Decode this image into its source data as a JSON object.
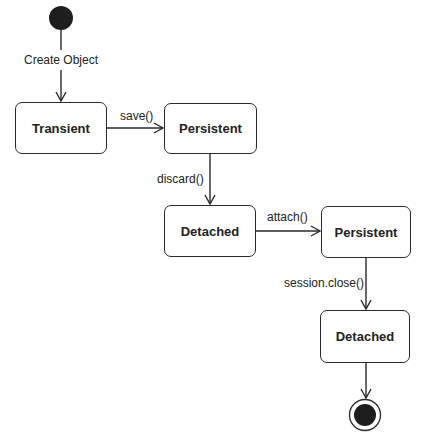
{
  "diagram": {
    "type": "UML state diagram",
    "initial_label": "Create Object",
    "states": [
      {
        "id": "transient",
        "label": "Transient"
      },
      {
        "id": "persistent1",
        "label": "Persistent"
      },
      {
        "id": "detached1",
        "label": "Detached"
      },
      {
        "id": "persistent2",
        "label": "Persistent"
      },
      {
        "id": "detached2",
        "label": "Detached"
      }
    ],
    "transitions": [
      {
        "from": "initial",
        "to": "transient",
        "label": "Create Object"
      },
      {
        "from": "transient",
        "to": "persistent1",
        "label": "save()"
      },
      {
        "from": "persistent1",
        "to": "detached1",
        "label": "discard()"
      },
      {
        "from": "detached1",
        "to": "persistent2",
        "label": "attach()"
      },
      {
        "from": "persistent2",
        "to": "detached2",
        "label": "session.close()"
      },
      {
        "from": "detached2",
        "to": "final",
        "label": ""
      }
    ]
  }
}
